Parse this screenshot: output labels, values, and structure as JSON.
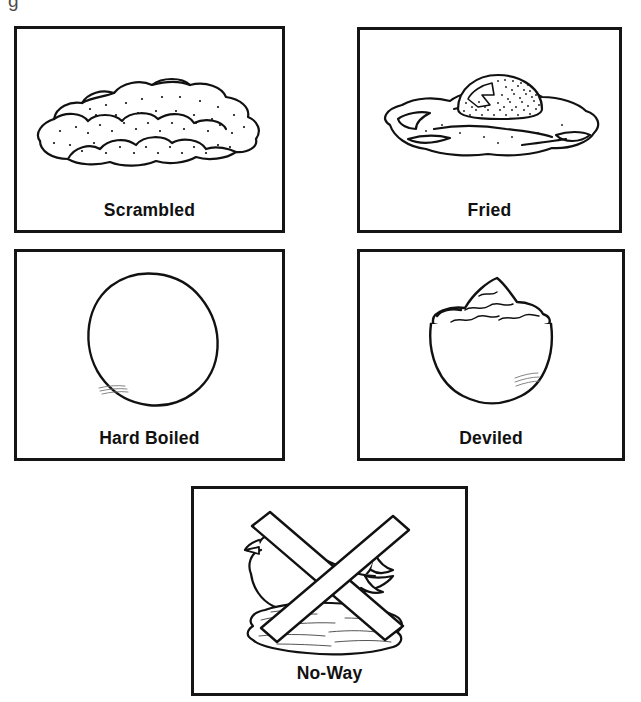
{
  "page": {
    "background_color": "#ffffff",
    "ink_color": "#111111",
    "artifact_glyph": "g"
  },
  "cards": [
    {
      "id": "scrambled",
      "label": "Scrambled",
      "icon": "scrambled-eggs-illustration",
      "description": "Fluffy mound of scrambled eggs with stippled texture"
    },
    {
      "id": "fried",
      "label": "Fried",
      "icon": "fried-egg-illustration",
      "description": "Sunny-side-up fried egg with stippled yolk and white"
    },
    {
      "id": "hardboiled",
      "label": "Hard Boiled",
      "icon": "hard-boiled-egg-illustration",
      "description": "Plain tilted egg oval outline"
    },
    {
      "id": "deviled",
      "label": "Deviled",
      "icon": "deviled-egg-illustration",
      "description": "Bowl heaped with deviled egg filling"
    },
    {
      "id": "noway",
      "label": "No-Way",
      "icon": "no-eggs-crossed-out-illustration",
      "description": "Hen on a nest of eggs crossed out with a large X"
    }
  ]
}
